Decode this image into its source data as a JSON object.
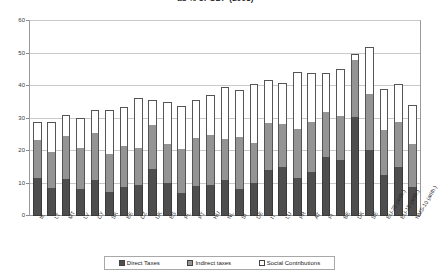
{
  "chart_data": {
    "type": "bar",
    "subtype": "stacked-bar",
    "title": "as % of GDP (2003)",
    "xlabel": "",
    "ylabel": "",
    "ylim": [
      0,
      60
    ],
    "yticks": [
      0,
      10,
      20,
      30,
      40,
      50,
      60
    ],
    "grid": true,
    "legend_position": "bottom",
    "categories": [
      "IE",
      "LT",
      "MT",
      "LV",
      "CY",
      "SK",
      "EE",
      "CZ",
      "UK",
      "ES",
      "PL",
      "PT",
      "HU",
      "NL",
      "SI",
      "DE",
      "IT",
      "LU",
      "FR",
      "AT",
      "FI",
      "BE",
      "DK",
      "SE",
      "EU-25 (arith.)",
      "EU-15 (arith.)",
      "NMS-10 (arith.)"
    ],
    "series": [
      {
        "name": "Direct Taxes",
        "color": "#4e4e4e",
        "values": [
          11.6,
          8.5,
          11.3,
          8.2,
          11.0,
          7.4,
          9.0,
          9.4,
          14.6,
          10.2,
          7.1,
          9.2,
          9.5,
          11.2,
          8.2,
          10.3,
          14.2,
          15.2,
          11.6,
          13.6,
          18.1,
          17.3,
          30.5,
          20.2,
          12.7,
          15.1,
          8.9
        ]
      },
      {
        "name": "Indirect taxes",
        "color": "#949494",
        "values": [
          11.9,
          11.2,
          13.2,
          12.6,
          14.5,
          11.8,
          12.6,
          11.6,
          13.5,
          12.0,
          13.6,
          14.8,
          15.5,
          12.6,
          16.2,
          12.3,
          14.5,
          13.2,
          15.2,
          15.2,
          13.9,
          13.5,
          17.6,
          17.2,
          13.8,
          13.9,
          13.4
        ]
      },
      {
        "name": "Social Contributions",
        "color": "#ffffff",
        "values": [
          5.5,
          9.1,
          6.7,
          9.5,
          7.0,
          13.3,
          11.8,
          15.2,
          7.6,
          13.0,
          13.2,
          11.6,
          12.3,
          15.9,
          14.5,
          17.9,
          13.0,
          12.5,
          17.6,
          15.2,
          12.1,
          14.5,
          1.9,
          14.6,
          12.5,
          11.5,
          11.8
        ]
      }
    ],
    "totals": [
      29.0,
      28.8,
      31.2,
      30.3,
      32.5,
      32.5,
      33.4,
      36.2,
      35.7,
      35.2,
      33.9,
      35.6,
      37.3,
      39.7,
      38.9,
      40.5,
      41.7,
      40.9,
      44.4,
      44.0,
      44.1,
      45.3,
      50.0,
      52.0,
      39.0,
      40.5,
      34.1
    ]
  },
  "legend": {
    "items": [
      {
        "label": "Direct Taxes",
        "swatch": "direct-swatch"
      },
      {
        "label": "Indirect taxes",
        "swatch": "indirect-swatch"
      },
      {
        "label": "Social Contributions",
        "swatch": "social-swatch"
      }
    ]
  }
}
